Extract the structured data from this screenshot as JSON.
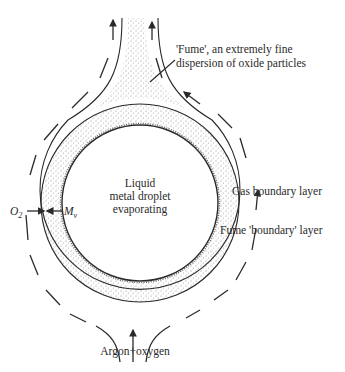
{
  "diagram": {
    "labels": {
      "fume": [
        "'Fume', an extremely fine",
        "dispersion of oxide particles"
      ],
      "droplet": [
        "Liquid",
        "metal droplet",
        "evaporating"
      ],
      "gas_layer": "Gas boundary layer",
      "fume_layer": "Fume 'boundary' layer",
      "o2": "O",
      "o2_sub": "2",
      "mv": "M",
      "mv_sub": "v",
      "inflow": "Argon+oxygen"
    },
    "colors": {
      "ink": "#2a2a2a",
      "stipple": "#8a8a8a",
      "background": "#ffffff"
    }
  }
}
